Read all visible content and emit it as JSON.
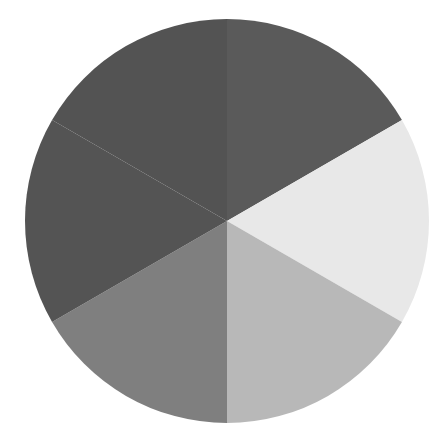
{
  "chart_data": {
    "type": "pie",
    "title": "",
    "subtitle": "",
    "xlabel": "",
    "ylabel": "",
    "grid": false,
    "legend_position": "none",
    "background_color": "#ffffff",
    "geometry": {
      "center_x": 227,
      "center_y": 221,
      "radius": 202,
      "start_angle_deg": 90,
      "direction": "clockwise",
      "stroke": "none"
    },
    "labels": [
      "Slice 1",
      "Slice 2",
      "Slice 3",
      "Slice 4",
      "Slice 5",
      "Slice 6"
    ],
    "values": [
      16.7,
      16.7,
      16.7,
      16.7,
      16.7,
      16.7
    ],
    "angles_deg": [
      60,
      60,
      60,
      60,
      60,
      60
    ],
    "colors": [
      "#5a5a5a",
      "#e8e8e8",
      "#b8b8b8",
      "#7f7f7f",
      "#545454",
      "#535353"
    ],
    "slices": [
      {
        "label": "Slice 1",
        "value": 16.7,
        "color": "#5a5a5a",
        "start_deg": 90,
        "end_deg": 30,
        "position": "upper-right"
      },
      {
        "label": "Slice 2",
        "value": 16.7,
        "color": "#e8e8e8",
        "start_deg": 30,
        "end_deg": -30,
        "position": "right"
      },
      {
        "label": "Slice 3",
        "value": 16.7,
        "color": "#b8b8b8",
        "start_deg": -30,
        "end_deg": -90,
        "position": "lower-right"
      },
      {
        "label": "Slice 4",
        "value": 16.7,
        "color": "#7f7f7f",
        "start_deg": -90,
        "end_deg": -150,
        "position": "lower-left"
      },
      {
        "label": "Slice 5",
        "value": 16.7,
        "color": "#545454",
        "start_deg": -150,
        "end_deg": -210,
        "position": "left"
      },
      {
        "label": "Slice 6",
        "value": 16.7,
        "color": "#535353",
        "start_deg": 150,
        "end_deg": 90,
        "position": "upper-left"
      }
    ]
  }
}
